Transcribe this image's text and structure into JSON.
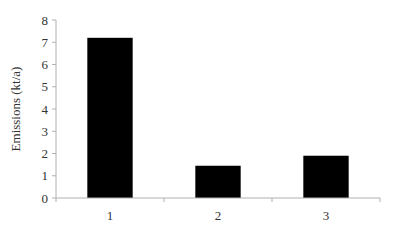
{
  "chart_data": {
    "type": "bar",
    "title": "",
    "xlabel": "",
    "ylabel": "Emissions (kt/a)",
    "categories": [
      "1",
      "2",
      "3"
    ],
    "values": [
      7.2,
      1.45,
      1.9
    ],
    "ylim": [
      0,
      8
    ],
    "yticks": [
      0,
      1,
      2,
      3,
      4,
      5,
      6,
      7,
      8
    ],
    "grid": false,
    "legend": null,
    "bar_color": "#000000",
    "axis_color": "#b0b0b0"
  }
}
